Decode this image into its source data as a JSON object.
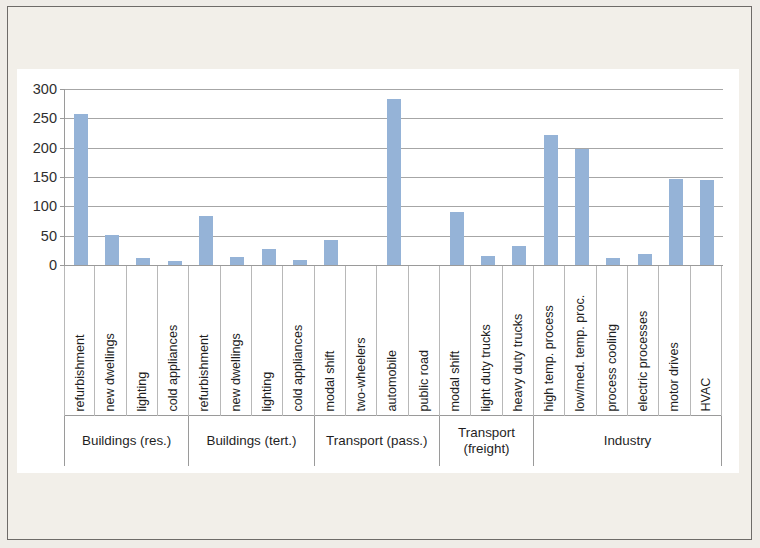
{
  "chart_data": {
    "type": "bar",
    "title": "",
    "subtitle": "",
    "xlabel": "",
    "ylabel": "",
    "ylim": [
      0,
      300
    ],
    "y_ticks": [
      0,
      50,
      100,
      150,
      200,
      250,
      300
    ],
    "grid": true,
    "legend": "none",
    "bar_color": "#95b3d7",
    "categories": [
      "refurbishment",
      "new dwellings",
      "lighting",
      "cold appliances",
      "refurbishment",
      "new dwellings",
      "lighting",
      "cold appliances",
      "modal shift",
      "two-wheelers",
      "automobile",
      "public road",
      "modal shift",
      "light duty trucks",
      "heavy duty trucks",
      "high temp. process",
      "low/med. temp. proc.",
      "process cooling",
      "electric processes",
      "motor drives",
      "HVAC"
    ],
    "values": [
      258,
      52,
      12,
      6,
      84,
      14,
      28,
      9,
      42,
      0,
      283,
      0,
      90,
      16,
      32,
      221,
      198,
      12,
      19,
      146,
      145
    ],
    "groups": [
      {
        "label": "Buildings (res.)",
        "span": 4
      },
      {
        "label": "Buildings (tert.)",
        "span": 4
      },
      {
        "label": "Transport (pass.)",
        "span": 4
      },
      {
        "label": "Transport\n(freight)",
        "span": 3
      },
      {
        "label": "Industry",
        "span": 6
      }
    ]
  }
}
